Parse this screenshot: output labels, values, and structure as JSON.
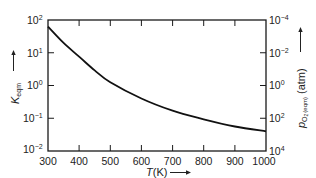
{
  "chart_data": {
    "type": "line",
    "title": "",
    "xlabel": "T(K)",
    "ylabel": "K_eqm",
    "y2label": "p_O2 (eqm) (atm)",
    "xscale": "linear",
    "yscale": "log",
    "xlim": [
      300,
      1000
    ],
    "ylim": [
      0.01,
      100
    ],
    "y2lim_labels_top_to_bottom": [
      "10^-4",
      "10^-2",
      "10^0",
      "10^2",
      "10^4"
    ],
    "x_ticks": [
      300,
      400,
      500,
      600,
      700,
      800,
      900,
      1000
    ],
    "y_ticks": [
      "10^2",
      "10^1",
      "10^0",
      "10^-1",
      "10^-2"
    ],
    "y2_ticks": [
      "10^-4",
      "10^-2",
      "10^0",
      "10^2",
      "10^4"
    ],
    "grid": false,
    "legend": null,
    "series": [
      {
        "name": "K_eqm",
        "x": [
          300,
          350,
          400,
          450,
          500,
          600,
          700,
          800,
          900,
          1000
        ],
        "values": [
          63,
          20,
          7.6,
          2.9,
          1.25,
          0.4,
          0.17,
          0.093,
          0.056,
          0.04
        ]
      }
    ]
  },
  "labels": {
    "x_title_italic": "T",
    "x_title_rest": "(K)",
    "y_left_main": "K",
    "y_left_sub": "eqm",
    "y_right_p": "p",
    "y_right_o": "O",
    "y_right_2": "2",
    "y_right_sub": "(eqm)",
    "y_right_unit": "(atm)"
  },
  "ticks": {
    "x": [
      "300",
      "400",
      "500",
      "600",
      "700",
      "800",
      "900",
      "1000"
    ],
    "left": [
      {
        "base": "10",
        "exp": "2"
      },
      {
        "base": "10",
        "exp": "1"
      },
      {
        "base": "10",
        "exp": "0"
      },
      {
        "base": "10",
        "exp": "−1"
      },
      {
        "base": "10",
        "exp": "−2"
      }
    ],
    "right": [
      {
        "base": "10",
        "exp": "−4"
      },
      {
        "base": "10",
        "exp": "−2"
      },
      {
        "base": "10",
        "exp": "0"
      },
      {
        "base": "10",
        "exp": "2"
      },
      {
        "base": "10",
        "exp": "4"
      }
    ]
  }
}
